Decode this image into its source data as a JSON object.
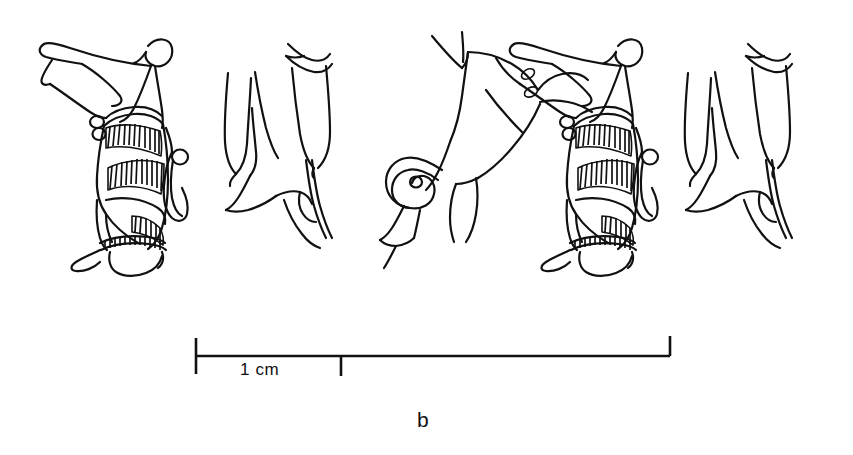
{
  "figure": {
    "panel_label": "b",
    "type": "archaeological line drawing",
    "background_color": "#ffffff",
    "ink_color": "#111111"
  },
  "scale_bar": {
    "label": "1 cm",
    "unit": "cm",
    "value": 1,
    "left_tick_x": 196,
    "division_tick_x": 341,
    "right_tick_x": 670,
    "baseline_y": 356,
    "total_length_px": 474,
    "one_cm_px": 145,
    "total_cm": 3.27
  },
  "motifs": [
    {
      "name": "kilted-figure",
      "index": 0,
      "x": 30,
      "y": 25,
      "width": 165,
      "height": 255,
      "details": [
        "outstretched arm",
        "curved crook over head",
        "hatched kilt",
        "hanging sash with bead",
        "beaded anklet",
        "forward foot"
      ]
    },
    {
      "name": "animal-legs",
      "index": 1,
      "x": 200,
      "y": 35,
      "width": 145,
      "height": 220,
      "details": [
        "two upright legs",
        "hoof terminations",
        "double-line hind limb"
      ]
    },
    {
      "name": "quadruped-body",
      "index": 2,
      "x": 375,
      "y": 28,
      "width": 165,
      "height": 215,
      "details": [
        "horned head",
        "eye",
        "curled tail spiral",
        "haunch",
        "rear leg"
      ]
    },
    {
      "name": "kilted-figure",
      "index": 3,
      "x": 500,
      "y": 25,
      "width": 165,
      "height": 255,
      "details": [
        "outstretched arm",
        "curved crook over head",
        "hatched kilt",
        "hanging sash with bead",
        "beaded anklet",
        "forward foot"
      ]
    },
    {
      "name": "animal-legs",
      "index": 4,
      "x": 660,
      "y": 35,
      "width": 160,
      "height": 225,
      "details": [
        "two upright legs",
        "hoof terminations",
        "double-line hind limb"
      ]
    }
  ]
}
